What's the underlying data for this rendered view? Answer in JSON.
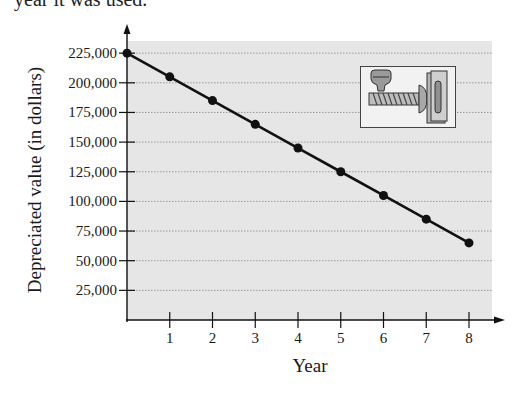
{
  "header": {
    "cut_text": "year it was used."
  },
  "chart_data": {
    "type": "line",
    "title": "",
    "xlabel": "Year",
    "ylabel": "Depreciated value (in dollars)",
    "x": [
      0,
      1,
      2,
      3,
      4,
      5,
      6,
      7,
      8
    ],
    "series": [
      {
        "name": "Depreciated value",
        "values": [
          225000,
          205000,
          185000,
          165000,
          145000,
          125000,
          105000,
          85000,
          65000
        ]
      }
    ],
    "x_ticks": [
      "1",
      "2",
      "3",
      "4",
      "5",
      "6",
      "7",
      "8"
    ],
    "y_ticks": [
      "225,000",
      "200,000",
      "175,000",
      "150,000",
      "125,000",
      "100,000",
      "75,000",
      "50,000",
      "25,000"
    ],
    "y_tick_values": [
      225000,
      200000,
      175000,
      150000,
      125000,
      100000,
      75000,
      50000,
      25000
    ],
    "xlim": [
      0,
      8.5
    ],
    "ylim": [
      0,
      235000
    ],
    "grid": "horizontal dotted",
    "legend": "none",
    "colors": {
      "plot_background": "#e6e6e6",
      "line": "#111111",
      "markers": "#111111",
      "gridline": "#9a9a9a"
    },
    "annotations": [
      "injection molding machine illustration (top right)"
    ]
  }
}
